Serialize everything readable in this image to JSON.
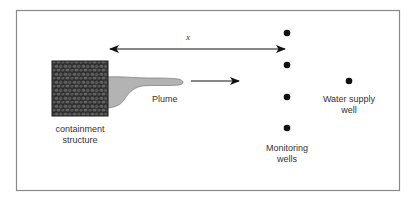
{
  "diagram": {
    "labels": {
      "distance": "x",
      "plume": "Plume",
      "containment_line1": "containment",
      "containment_line2": "structure",
      "monitoring_line1": "Monitoring",
      "monitoring_line2": "wells",
      "supply_line1": "Water supply",
      "supply_line2": "well"
    },
    "elements": {
      "containment_structure": {
        "x": 52,
        "y": 61,
        "w": 56,
        "h": 55
      },
      "monitoring_wells": [
        {
          "x": 287,
          "y": 33
        },
        {
          "x": 287,
          "y": 65
        },
        {
          "x": 287,
          "y": 97
        },
        {
          "x": 287,
          "y": 128
        }
      ],
      "water_supply_well": {
        "x": 349,
        "y": 81
      }
    },
    "colors": {
      "frame": "#888888",
      "containment_fill": "#2b2b2b",
      "containment_pattern": "#5a5a5a",
      "plume_fill": "#b3b3b3",
      "ink": "#111111"
    }
  }
}
